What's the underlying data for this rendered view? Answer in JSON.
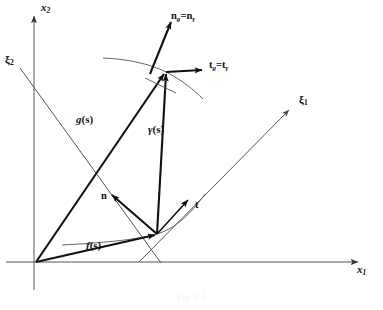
{
  "figure": {
    "caption": "Fig. 2.1",
    "background_color": "#ffffff",
    "ink_color": "#111111",
    "thin_ink_color": "#555555"
  },
  "axes": [
    {
      "id": "x2",
      "name": "vertical-axis",
      "label": "x",
      "subscript": "2",
      "label_x": 40,
      "label_y": 4,
      "from": [
        34,
        290
      ],
      "to": [
        34,
        14
      ]
    },
    {
      "id": "x1",
      "name": "horizontal-axis",
      "label": "x",
      "subscript": "1",
      "label_x": 358,
      "label_y": 265,
      "from": [
        6,
        262
      ],
      "to": [
        362,
        262
      ]
    }
  ],
  "oblique_axes": [
    {
      "id": "xi1",
      "name": "xi-1-axis",
      "label": "ξ",
      "subscript": "1",
      "label_x": 300,
      "label_y": 96,
      "from": [
        139,
        262
      ],
      "to": [
        291,
        108
      ]
    },
    {
      "id": "xi2",
      "name": "xi-2-axis",
      "label": "ξ",
      "subscript": "2",
      "label_x": 6,
      "label_y": 56,
      "from": [
        19,
        67
      ],
      "to": [
        160,
        262
      ]
    }
  ],
  "vectors": [
    {
      "id": "f",
      "name": "vector-f",
      "label": "f",
      "arg": "(s)",
      "label_x": 88,
      "label_y": 244,
      "from": [
        36,
        262
      ],
      "to": [
        157,
        234
      ]
    },
    {
      "id": "g",
      "name": "vector-g",
      "label": "g",
      "arg": "(s)",
      "label_x": 78,
      "label_y": 118,
      "from": [
        36,
        262
      ],
      "to": [
        165,
        72
      ]
    },
    {
      "id": "gamma",
      "name": "vector-gamma",
      "label": "γ",
      "arg": "(s)",
      "label_x": 150,
      "label_y": 128,
      "from": [
        157,
        234
      ],
      "to": [
        166,
        72
      ]
    },
    {
      "id": "n",
      "name": "normal-vector-n",
      "label": "n",
      "arg": "",
      "label_x": 103,
      "label_y": 196,
      "from": [
        157,
        234
      ],
      "to": [
        110,
        194
      ]
    },
    {
      "id": "t",
      "name": "tangent-vector-t",
      "label": "t",
      "arg": "",
      "label_x": 196,
      "label_y": 205,
      "from": [
        157,
        234
      ],
      "to": [
        190,
        198
      ]
    },
    {
      "id": "n_g",
      "name": "normal-vector-n-g-equals-n-gamma",
      "label": "n",
      "sub_a": "g",
      "eq": "=",
      "label2": "n",
      "sub_b": "γ",
      "label_x": 172,
      "label_y": 14,
      "from": [
        152,
        70
      ],
      "to": [
        172,
        20
      ]
    },
    {
      "id": "t_g",
      "name": "tangent-vector-t-g-equals-t-gamma",
      "label": "t",
      "sub_a": "g",
      "eq": "=",
      "label2": "t",
      "sub_b": "γ",
      "label_x": 210,
      "label_y": 63,
      "from": [
        166,
        72
      ],
      "to": [
        204,
        70
      ]
    }
  ],
  "curves": [
    {
      "id": "lower-curve",
      "name": "lower-curve-through-f",
      "description": "curve through point f(s) with tangent t"
    },
    {
      "id": "upper-curve",
      "name": "upper-curve-through-g",
      "description": "curve through point g(s) with tangent t_g"
    }
  ]
}
